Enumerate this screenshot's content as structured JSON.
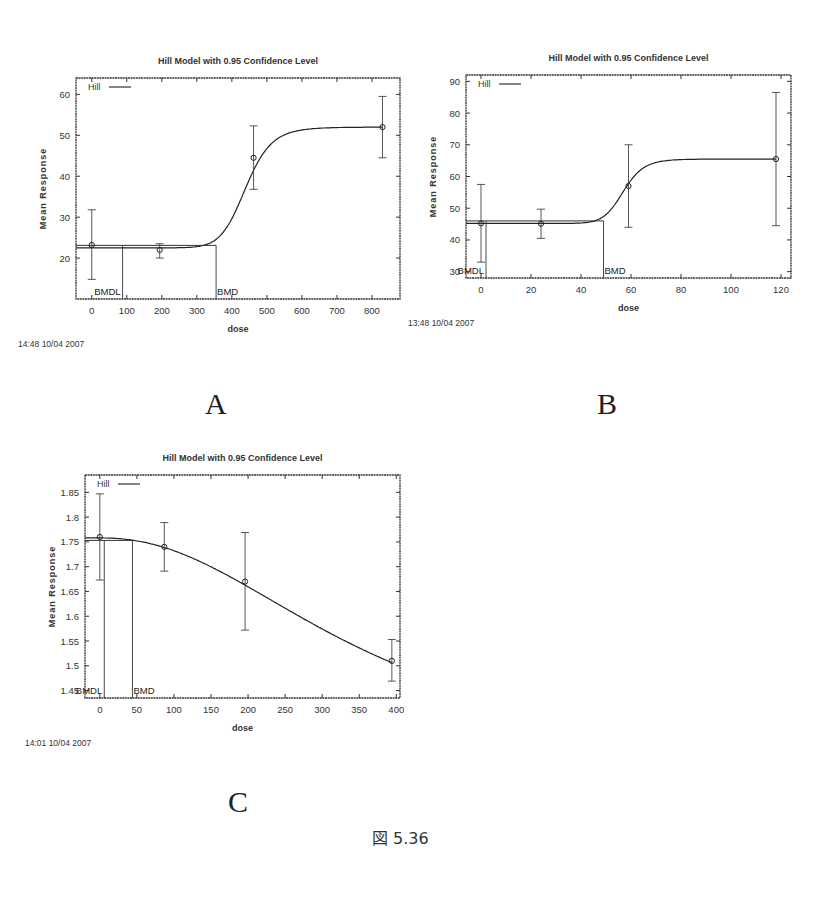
{
  "figure": {
    "caption": "図 5.36",
    "panels": [
      {
        "label": "A"
      },
      {
        "label": "B"
      },
      {
        "label": "C"
      }
    ]
  },
  "chart_data": [
    {
      "panel": "A",
      "type": "line",
      "title": "Hill Model with 0.95 Confidence Level",
      "xlabel": "dose",
      "ylabel": "Mean Response",
      "timestamp": "14:48 10/04 2007",
      "legend": {
        "entries": [
          "Hill"
        ],
        "position": "top-left"
      },
      "xlim": [
        -45,
        880
      ],
      "ylim": [
        10,
        64
      ],
      "xticks": [
        0,
        100,
        200,
        300,
        400,
        500,
        600,
        700,
        800
      ],
      "yticks": [
        20,
        30,
        40,
        50,
        60
      ],
      "grid": false,
      "observed": [
        {
          "dose": 0,
          "mean": 23.2,
          "ci_low": 14.8,
          "ci_high": 31.8
        },
        {
          "dose": 194,
          "mean": 22.0,
          "ci_low": 20.0,
          "ci_high": 23.5
        },
        {
          "dose": 462,
          "mean": 44.5,
          "ci_low": 36.8,
          "ci_high": 52.3
        },
        {
          "dose": 830,
          "mean": 52.0,
          "ci_low": 44.5,
          "ci_high": 59.5
        }
      ],
      "hill_fit": {
        "baseline": 22.5,
        "plateau": 52.0,
        "ed50": 440,
        "n": 12
      },
      "bmd": {
        "label": "BMD",
        "dose": 355,
        "response": 23.1
      },
      "bmdl": {
        "label": "BMDL",
        "dose": 88,
        "response": 23.1
      }
    },
    {
      "panel": "B",
      "type": "line",
      "title": "Hill Model with 0.95 Confidence Level",
      "xlabel": "dose",
      "ylabel": "Mean Response",
      "timestamp": "13:48 10/04 2007",
      "legend": {
        "entries": [
          "Hill"
        ],
        "position": "top-left"
      },
      "xlim": [
        -6,
        124
      ],
      "ylim": [
        28,
        92
      ],
      "xticks": [
        0,
        20,
        40,
        60,
        80,
        100,
        120
      ],
      "yticks": [
        30,
        40,
        50,
        60,
        70,
        80,
        90
      ],
      "grid": false,
      "observed": [
        {
          "dose": 0,
          "mean": 45.2,
          "ci_low": 33.0,
          "ci_high": 57.5
        },
        {
          "dose": 24,
          "mean": 45.1,
          "ci_low": 40.5,
          "ci_high": 49.7
        },
        {
          "dose": 59,
          "mean": 57.0,
          "ci_low": 44.0,
          "ci_high": 70.0
        },
        {
          "dose": 118,
          "mean": 65.5,
          "ci_low": 44.5,
          "ci_high": 86.5
        }
      ],
      "hill_fit": {
        "baseline": 45.2,
        "plateau": 65.5,
        "ed50": 57,
        "n": 14
      },
      "bmd": {
        "label": "BMD",
        "dose": 49,
        "response": 46.0
      },
      "bmdl": {
        "label": "BMDL",
        "dose": 2,
        "response": 46.0
      }
    },
    {
      "panel": "C",
      "type": "line",
      "title": "Hill Model with 0.95 Confidence Level",
      "xlabel": "dose",
      "ylabel": "Mean Response",
      "timestamp": "14:01 10/04 2007",
      "legend": {
        "entries": [
          "Hill"
        ],
        "position": "top-left"
      },
      "xlim": [
        -20,
        405
      ],
      "ylim": [
        1.435,
        1.885
      ],
      "xticks": [
        0,
        50,
        100,
        150,
        200,
        250,
        300,
        350,
        400
      ],
      "yticks": [
        1.45,
        1.5,
        1.55,
        1.6,
        1.65,
        1.7,
        1.75,
        1.8,
        1.85
      ],
      "grid": false,
      "observed": [
        {
          "dose": 0,
          "mean": 1.76,
          "ci_low": 1.673,
          "ci_high": 1.847
        },
        {
          "dose": 87,
          "mean": 1.74,
          "ci_low": 1.691,
          "ci_high": 1.789
        },
        {
          "dose": 196,
          "mean": 1.67,
          "ci_low": 1.572,
          "ci_high": 1.769
        },
        {
          "dose": 394,
          "mean": 1.51,
          "ci_low": 1.469,
          "ci_high": 1.553
        }
      ],
      "hill_fit": {
        "baseline": 1.758,
        "plateau": 1.3,
        "ed50": 360,
        "n": 2.2
      },
      "bmd": {
        "label": "BMD",
        "dose": 44,
        "response": 1.753
      },
      "bmdl": {
        "label": "BMDL",
        "dose": 6,
        "response": 1.753
      }
    }
  ]
}
